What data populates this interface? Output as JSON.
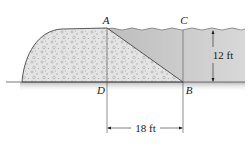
{
  "figure": {
    "labels": {
      "A": "A",
      "B": "B",
      "C": "C",
      "D": "D"
    },
    "dimensions": {
      "water_depth": "12 ft",
      "base_width": "18 ft"
    }
  },
  "colors": {
    "water_top": "#b9b9b9",
    "water_bottom": "#e6e6e6",
    "dam_fill": "#e2e2e2",
    "dam_speckle": "#9a9a9a",
    "outline": "#333333",
    "ground_shadow": "#c8c8c8"
  }
}
